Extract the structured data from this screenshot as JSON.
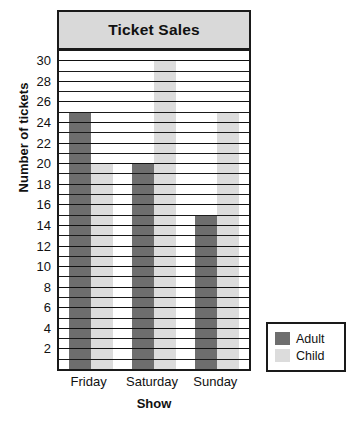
{
  "chart_data": {
    "type": "bar",
    "title": "Ticket Sales",
    "xlabel": "Show",
    "ylabel": "Number of tickets",
    "categories": [
      "Friday",
      "Saturday",
      "Sunday"
    ],
    "series": [
      {
        "name": "Adult",
        "color": "#6e6e6e",
        "values": [
          25,
          20,
          15
        ]
      },
      {
        "name": "Child",
        "color": "#dcdcdc",
        "values": [
          20,
          30,
          25
        ]
      }
    ],
    "ylim": [
      0,
      31
    ],
    "ytick_step": 2,
    "yticks": [
      2,
      4,
      6,
      8,
      10,
      12,
      14,
      16,
      18,
      20,
      22,
      24,
      26,
      28,
      30
    ],
    "ytick_labels": [
      "2",
      "4",
      "6",
      "8",
      "10",
      "12",
      "14",
      "16",
      "18",
      "20",
      "22",
      "24",
      "26",
      "28",
      "30"
    ],
    "gridlines": true,
    "gridline_step": 1,
    "grid_color": "#1a1a1a",
    "legend_position": "right-bottom",
    "legend_entries": [
      "Adult",
      "Child"
    ],
    "title_band_color": "#d9d9d9",
    "frame_color": "#1a1a1a",
    "background": "#ffffff"
  }
}
